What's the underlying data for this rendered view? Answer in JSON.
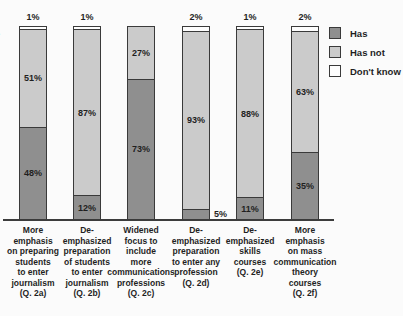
{
  "left_edge_fragment": "s",
  "colors": {
    "has": "#8f8f8f",
    "has_not": "#cbcbcb",
    "dont_know": "#fdfdfd",
    "border": "#3a3a3a",
    "axis": "#3c3c3c",
    "background": "#fbfbfb",
    "text": "#1f1f1f"
  },
  "chart_data": {
    "type": "bar",
    "stacked": true,
    "orientation": "vertical",
    "title": "",
    "xlabel": "",
    "ylabel": "",
    "ylim": [
      0,
      100
    ],
    "grid": false,
    "legend_position": "top-right",
    "value_suffix": "%",
    "categories": [
      "More\nemphasis\non preparing\nstudents\nto enter\njournalism\n(Q. 2a)",
      "De-\nemphasized\npreparation\nof students\nto enter\njournalism\n(Q. 2b)",
      "Widened\nfocus to\ninclude\nmore\ncommunications\nprofessions\n(Q. 2c)",
      "De-\nemphasized\npreparation\nto enter any\nprofession\n(Q. 2d)",
      "De-\nemphasized\nskills\ncourses\n(Q. 2e)",
      "More\nemphasis\non mass\ncommunication\ntheory\ncourses\n(Q. 2f)"
    ],
    "series": [
      {
        "name": "Has",
        "color": "#8f8f8f",
        "values": [
          48,
          12,
          73,
          5,
          11,
          35
        ]
      },
      {
        "name": "Has not",
        "color": "#cbcbcb",
        "values": [
          51,
          87,
          27,
          93,
          88,
          63
        ]
      },
      {
        "name": "Don't know",
        "color": "#fdfdfd",
        "values": [
          1,
          1,
          0,
          2,
          1,
          2
        ]
      }
    ]
  }
}
